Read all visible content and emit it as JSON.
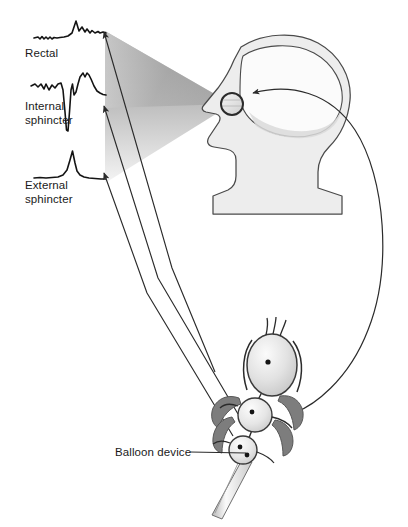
{
  "figure": {
    "labels": {
      "rectal": "Rectal",
      "internal_sphincter_line1": "Internal",
      "internal_sphincter_line2": "sphincter",
      "external_sphincter_line1": "External",
      "external_sphincter_line2": "sphincter",
      "balloon_device": "Balloon device"
    }
  },
  "traces": [
    {
      "name": "rectal",
      "label": "Rectal",
      "description": "low flat baseline with small ripples then a single tall narrow peak followed by low noisy oscillations",
      "points": "34,38 40,37 43,39 46,36 49,39 52,37 55,38 62,37 70,36 76,22 80,32 84,28 87,33 90,30 93,34 96,31 99,33 102,32 105,33"
    },
    {
      "name": "internal-sphincter",
      "label": "Internal sphincter",
      "description": "noisy baseline, deep sharp downward deflection, then rebound to a tall rounded double peak",
      "points": "32,86 38,84 43,88 47,82 51,90 55,84 58,88 61,83 64,95 66,128 68,131 70,104 71,86 73,96 76,92 79,80 82,74 85,78 88,72 91,76 94,86 98,92 102,94 105,95"
    },
    {
      "name": "external-sphincter",
      "label": "External sphincter",
      "description": "flat baseline with one narrow tall symmetric spike",
      "points": "34,178 44,177 52,178 60,176 66,174 70,170 73,152 76,168 79,174 83,177 88,178 94,178 100,179 106,179"
    }
  ],
  "cone": {
    "name": "visual-feedback-cone",
    "description": "gray gradient fan spreading from the eye leftward to the three traces",
    "apex": [
      232,
      104
    ],
    "top_left": [
      105,
      32
    ],
    "bottom_left": [
      105,
      182
    ],
    "color_dark": "#8f8f8f",
    "color_light": "#e9e9e9"
  },
  "arrows": {
    "trace_arrows": [
      {
        "name": "arrow-to-rectal-trace",
        "tip": [
          103,
          31
        ],
        "elbow": [
          172,
          268
        ],
        "tail": [
          215,
          372
        ]
      },
      {
        "name": "arrow-to-internal-sphincter-trace",
        "tip": [
          103,
          105
        ],
        "elbow": [
          158,
          278
        ],
        "tail": [
          235,
          412
        ]
      },
      {
        "name": "arrow-to-external-sphincter-trace",
        "tip": [
          103,
          172
        ],
        "elbow": [
          148,
          292
        ],
        "tail": [
          232,
          432
        ]
      }
    ],
    "brain_arrow": {
      "name": "arrow-device-to-brain",
      "description": "long bow-shaped curve from the balloon device up the right side to the brain, arrowheads at both ends",
      "brain_tip": [
        253,
        93
      ],
      "device_tip": [
        295,
        412
      ]
    },
    "balloon_leader": {
      "name": "balloon-device-leader-line",
      "from": [
        190,
        452
      ],
      "to": [
        248,
        452
      ]
    }
  },
  "head": {
    "name": "head-profile",
    "description": "left-facing human head in profile with brain outline and eye circle",
    "fill": "#ededed",
    "outline": "#4a4a4a",
    "eye_center": [
      232,
      104
    ],
    "eye_radius": 11
  },
  "device": {
    "name": "balloon-device",
    "description": "three stacked balloons with dark muscle flanges and a catheter tube extending down-left",
    "balloons": [
      {
        "name": "rectal-balloon",
        "cx": 272,
        "cy": 365,
        "rx": 25,
        "ry": 31
      },
      {
        "name": "internal-sphincter-balloon",
        "cx": 255,
        "cy": 415,
        "rx": 17,
        "ry": 17
      },
      {
        "name": "external-sphincter-balloon",
        "cx": 243,
        "cy": 450,
        "rx": 14,
        "ry": 14
      }
    ],
    "fill_light": "#f2f2f2",
    "fill_mid": "#cfcfcf",
    "muscle_fill": "#7d7d7d",
    "catheter_fill": "#e3e3e3"
  },
  "colors": {
    "background": "#ffffff",
    "ink": "#1a1a1a",
    "line": "#3a3a3a",
    "gray_light": "#ededed",
    "gray_mid": "#bfbfbf",
    "gray_dark": "#7d7d7d"
  }
}
